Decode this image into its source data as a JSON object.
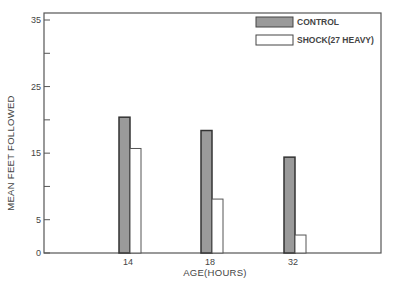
{
  "chart_data": {
    "type": "bar",
    "title": "",
    "xlabel": "AGE(HOURS)",
    "ylabel": "MEAN FEET FOLLOWED",
    "categories": [
      "14",
      "18",
      "32"
    ],
    "series": [
      {
        "name": "CONTROL",
        "values": [
          20.4,
          18.4,
          14.4
        ],
        "color": "#9a9a9a"
      },
      {
        "name": "SHOCK(27 HEAVY)",
        "values": [
          15.7,
          8.1,
          2.7
        ],
        "color": "#ffffff"
      }
    ],
    "ylim": [
      0,
      36
    ],
    "yticks": [
      0,
      5,
      10,
      15,
      20,
      25,
      30,
      35
    ],
    "ytick_labels": [
      "0",
      "5",
      "",
      "15",
      "",
      "25",
      "",
      "35"
    ],
    "grid": false,
    "legend_position": "upper right"
  },
  "legend": {
    "items": [
      {
        "label": "CONTROL"
      },
      {
        "label": "SHOCK(27 HEAVY)"
      }
    ]
  },
  "axes": {
    "xlabel": "AGE(HOURS)",
    "ylabel": "MEAN FEET FOLLOWED",
    "xticks": [
      "14",
      "18",
      "32"
    ]
  }
}
